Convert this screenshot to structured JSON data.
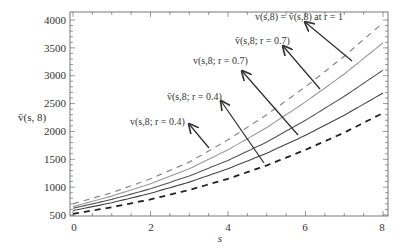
{
  "chart_data": {
    "type": "line",
    "title": "",
    "xlabel": "s",
    "ylabel": "v̄(s, 8)",
    "xlim": [
      0,
      8
    ],
    "ylim": [
      500,
      4100
    ],
    "x_ticks": [
      0,
      2,
      4,
      6,
      8
    ],
    "y_ticks": [
      500,
      1000,
      1500,
      2000,
      2500,
      3000,
      3500,
      4000
    ],
    "grid": false,
    "legend": "none (arrow annotations)",
    "x": [
      0,
      1,
      2,
      3,
      4,
      5,
      6,
      7,
      8
    ],
    "series": [
      {
        "name": "v(s,8) = v̄(s,8) at r = 1 (upper, grey dashed)",
        "style": "dashed",
        "color": "#8a8a8a",
        "values": [
          700,
          900,
          1150,
          1450,
          1850,
          2300,
          2800,
          3350,
          3950
        ]
      },
      {
        "name": "v̄(s,8; r=0.7)",
        "style": "solid",
        "color": "#9a9a9a",
        "values": [
          650,
          840,
          1060,
          1330,
          1670,
          2070,
          2530,
          3030,
          3590
        ]
      },
      {
        "name": "v̄(s,8; r=0.4)",
        "style": "solid",
        "color": "#555555",
        "values": [
          620,
          780,
          970,
          1200,
          1480,
          1810,
          2200,
          2630,
          3100
        ]
      },
      {
        "name": "v(s,8; r=0.7) / v(s,8; r=0.4) (lower solid)",
        "style": "solid",
        "color": "#444444",
        "values": [
          580,
          720,
          890,
          1090,
          1330,
          1610,
          1930,
          2290,
          2690
        ]
      },
      {
        "name": "v(s,8) = v̄(s,8) at r = 1 (lower, black dashed)",
        "style": "dashed",
        "color": "#222222",
        "values": [
          520,
          640,
          780,
          950,
          1150,
          1390,
          1670,
          1980,
          2330
        ]
      }
    ],
    "annotations": [
      {
        "text": "v(s,8) = v̄(s,8) at r = 1",
        "arrow_to_x": 7.2
      },
      {
        "text": "v̄(s,8; r = 0.7)",
        "arrow_to_x": 5.9
      },
      {
        "text": "v(s,8; r = 0.7)",
        "arrow_to_x": 5.1
      },
      {
        "text": "v̄(s,8; r = 0.4)",
        "arrow_to_x": 4.8
      },
      {
        "text": "v(s,8; r = 0.4)",
        "arrow_to_x": 3.4
      }
    ]
  },
  "labels": {
    "xlabel": "s",
    "ylabel": "v̄(s, 8)",
    "ann_r1": "v(s,8) = v̄(s,8) at r = 1",
    "ann_vbar07": "v̄(s,8; r = 0.7)",
    "ann_v07": "v(s,8; r = 0.7)",
    "ann_vbar04": "v̄(s,8; r = 0.4)",
    "ann_v04": "v(s,8; r = 0.4)",
    "xt0": "0",
    "xt2": "2",
    "xt4": "4",
    "xt6": "6",
    "xt8": "8",
    "yt500": "500",
    "yt1000": "1000",
    "yt1500": "1500",
    "yt2000": "2000",
    "yt2500": "2500",
    "yt3000": "3000",
    "yt3500": "3500",
    "yt4000": "4000"
  }
}
